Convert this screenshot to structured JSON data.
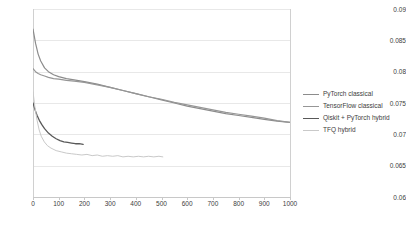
{
  "chart_data": {
    "type": "line",
    "title": "",
    "subtitle": "",
    "xlabel": "",
    "ylabel": "",
    "xlim": [
      0,
      1000
    ],
    "ylim": [
      0.06,
      0.09
    ],
    "grid": true,
    "legend_position": "right",
    "x_ticks": [
      "0",
      "100",
      "200",
      "300",
      "400",
      "500",
      "600",
      "700",
      "800",
      "900",
      "1000"
    ],
    "x_tick_values": [
      0,
      100,
      200,
      300,
      400,
      500,
      600,
      700,
      800,
      900,
      1000
    ],
    "y_ticks": [
      "0.06",
      "0.065",
      "0.07",
      "0.075",
      "0.08",
      "0.085",
      "0.09"
    ],
    "y_tick_values": [
      0.06,
      0.065,
      0.07,
      0.075,
      0.08,
      0.085,
      0.09
    ],
    "series": [
      {
        "name": "PyTorch classical",
        "color": "#8c8c8c",
        "width": 1.2,
        "x": [
          0,
          10,
          20,
          30,
          45,
          60,
          80,
          100,
          130,
          160,
          200,
          250,
          300,
          350,
          400,
          450,
          500,
          550,
          600,
          650,
          700,
          750,
          800,
          850,
          900,
          950,
          1000
        ],
        "y": [
          0.0868,
          0.0845,
          0.0828,
          0.0817,
          0.0806,
          0.08,
          0.0795,
          0.0792,
          0.0789,
          0.0787,
          0.0784,
          0.078,
          0.0775,
          0.077,
          0.0765,
          0.076,
          0.0755,
          0.075,
          0.0745,
          0.0741,
          0.0737,
          0.0733,
          0.073,
          0.0727,
          0.0724,
          0.0721,
          0.0719
        ]
      },
      {
        "name": "TensorFlow classical",
        "color": "#969696",
        "width": 1.2,
        "x": [
          0,
          10,
          20,
          30,
          45,
          60,
          80,
          100,
          130,
          160,
          200,
          250,
          300,
          350,
          400,
          450,
          500,
          550,
          600,
          650,
          700,
          750,
          800,
          850,
          900,
          950,
          1000
        ],
        "y": [
          0.0805,
          0.08,
          0.0797,
          0.0795,
          0.0793,
          0.0791,
          0.0789,
          0.0788,
          0.0786,
          0.0785,
          0.0783,
          0.0779,
          0.0775,
          0.077,
          0.0765,
          0.076,
          0.0756,
          0.0751,
          0.0747,
          0.0743,
          0.0739,
          0.0735,
          0.0732,
          0.0729,
          0.0726,
          0.0722,
          0.0719
        ]
      },
      {
        "name": "Qiskit + PyTorch hybrid",
        "color": "#595959",
        "width": 1.3,
        "x": [
          0,
          8,
          16,
          25,
          35,
          45,
          60,
          75,
          90,
          105,
          120,
          135,
          150,
          165,
          180,
          195
        ],
        "y": [
          0.075,
          0.0739,
          0.073,
          0.0722,
          0.0715,
          0.0709,
          0.0702,
          0.0697,
          0.0693,
          0.069,
          0.0688,
          0.0687,
          0.0686,
          0.0685,
          0.0685,
          0.0684
        ]
      },
      {
        "name": "TFQ hybrid",
        "color": "#c9c9c9",
        "width": 1.0,
        "x": [
          0,
          8,
          16,
          24,
          32,
          44,
          56,
          70,
          90,
          110,
          130,
          150,
          170,
          190,
          210,
          230,
          250,
          270,
          290,
          310,
          330,
          350,
          370,
          390,
          410,
          430,
          450,
          470,
          490,
          505
        ],
        "y": [
          0.0768,
          0.0742,
          0.0722,
          0.0707,
          0.0697,
          0.0688,
          0.0682,
          0.0678,
          0.0674,
          0.0672,
          0.067,
          0.0669,
          0.0668,
          0.0667,
          0.0668,
          0.0666,
          0.0667,
          0.0665,
          0.0666,
          0.0665,
          0.0666,
          0.0664,
          0.0665,
          0.0664,
          0.0665,
          0.0664,
          0.0665,
          0.0664,
          0.0665,
          0.0664
        ]
      }
    ]
  },
  "legend": {
    "items": [
      {
        "label": "PyTorch classical",
        "color": "#8c8c8c"
      },
      {
        "label": "TensorFlow classical",
        "color": "#969696"
      },
      {
        "label": "Qiskit + PyTorch hybrid",
        "color": "#595959"
      },
      {
        "label": "TFQ hybrid",
        "color": "#c9c9c9"
      }
    ]
  }
}
